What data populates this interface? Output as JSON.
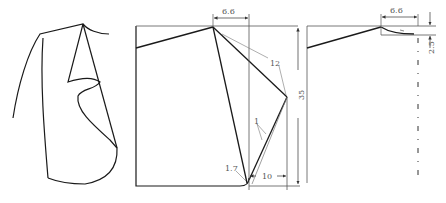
{
  "diagram": {
    "type": "garment pattern drafting (lapel/collar)",
    "colors": {
      "stroke": "#1a1a1a",
      "thin": "#666666",
      "text": "#555555"
    },
    "dimensions": {
      "top_width_main": "6.6",
      "lapel_length": "12",
      "height": "35",
      "roll_offset": "1",
      "bottom_width": "10",
      "corner_radius": "1.7",
      "top_width_right": "6.6",
      "collar_drop": "2.5"
    }
  }
}
